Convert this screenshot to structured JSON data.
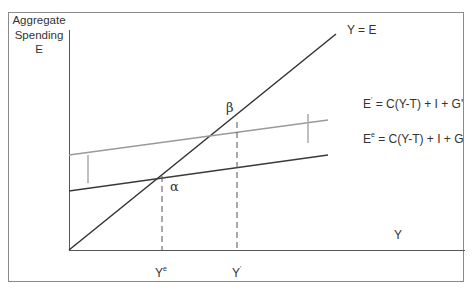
{
  "diagram": {
    "type": "keynesian-cross",
    "y_axis_label": [
      "Aggregate",
      "Spending",
      "E"
    ],
    "x_axis_label": "Y",
    "lines": {
      "forty_five": {
        "label": "Y = E",
        "color": "#333333"
      },
      "original": {
        "label_base": "E",
        "label_sup": "e",
        "label_rest": " = C(Y-T) + I + G",
        "color": "#3a3a3a"
      },
      "shifted": {
        "label_base": "E",
        "label_sup": "'",
        "label_rest": " = C(Y-T) + I + G'",
        "color": "#9a9a9a"
      }
    },
    "points": {
      "alpha": "α",
      "beta": "β"
    },
    "x_ticks": {
      "ye_base": "Y",
      "ye_sup": "e",
      "yp_base": "Y",
      "yp_sup": "'"
    },
    "colors": {
      "axis": "#555555",
      "dark_line": "#3a3a3a",
      "gray_line": "#9a9a9a",
      "marker": "#aaaaaa",
      "frame": "#8a8a8a"
    }
  }
}
